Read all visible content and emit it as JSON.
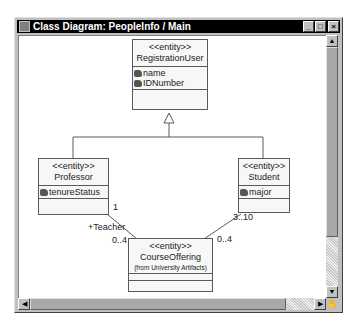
{
  "window": {
    "title": "Class Diagram: PeopleInfo / Main",
    "controls": {
      "minimize": "_",
      "maximize": "□",
      "close": "×"
    }
  },
  "diagram": {
    "classes": {
      "registration_user": {
        "stereotype": "<<entity>>",
        "name": "RegistrationUser",
        "attributes": [
          "name",
          "IDNumber"
        ]
      },
      "professor": {
        "stereotype": "<<entity>>",
        "name": "Professor",
        "attributes": [
          "tenureStatus"
        ]
      },
      "student": {
        "stereotype": "<<entity>>",
        "name": "Student",
        "attributes": [
          "major"
        ]
      },
      "course_offering": {
        "stereotype": "<<entity>>",
        "name": "CourseOffering",
        "from": "(from University Artifacts)",
        "attributes": []
      }
    },
    "relationships": {
      "generalization": "Professor, Student → RegistrationUser",
      "professor_course": {
        "professor_end": "1",
        "role": "+Teacher",
        "course_end": "0..4"
      },
      "student_course": {
        "student_end": "3..10",
        "course_end": "0..4"
      }
    }
  },
  "scrollbars": {
    "up_arrow": "▲",
    "down_arrow": "▼",
    "left_arrow": "◀",
    "right_arrow": "▶",
    "grip": "✋"
  }
}
